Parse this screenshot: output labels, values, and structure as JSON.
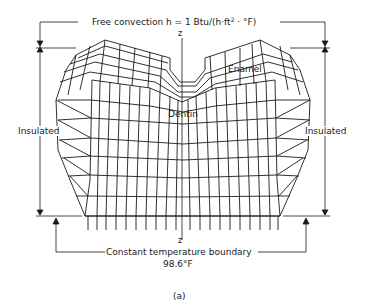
{
  "figure": {
    "panel_label": "(a)",
    "top_boundary": {
      "text_prefix": "Free convection h = 1 Btu/(h·ft",
      "superscript": "2",
      "text_suffix": " · °F)"
    },
    "left_boundary": "Insulated",
    "right_boundary": "Insulated",
    "bottom_boundary": {
      "line1": "Constant temperature boundary",
      "line2": "98.6°F"
    },
    "axis_label_top": "z",
    "axis_label_bottom": "z",
    "regions": {
      "enamel": "Enamel",
      "dentin": "Dentin"
    }
  }
}
